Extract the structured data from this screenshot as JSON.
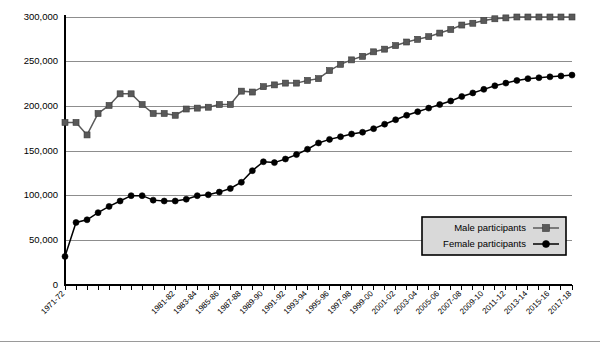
{
  "chart_data": {
    "type": "line",
    "title": "",
    "subtitle": "",
    "xlabel": "",
    "ylabel": "",
    "ylim": [
      0,
      300000
    ],
    "ytick_values": [
      0,
      50000,
      100000,
      150000,
      200000,
      250000,
      300000
    ],
    "ytick_labels": [
      "0",
      "50,000",
      "100,000",
      "150,000",
      "200,000",
      "250,000",
      "300,000"
    ],
    "grid": true,
    "legend_position": "bottom-right-inside",
    "x": [
      "1971-72",
      "1972-73",
      "1973-74",
      "1974-75",
      "1975-76",
      "1976-77",
      "1977-78",
      "1978-79",
      "1979-80",
      "1980-81",
      "1981-82",
      "1982-83",
      "1983-84",
      "1984-85",
      "1985-86",
      "1986-87",
      "1987-88",
      "1988-89",
      "1989-90",
      "1990-91",
      "1991-92",
      "1992-93",
      "1993-94",
      "1994-95",
      "1995-96",
      "1996-97",
      "1997-98",
      "1998-99",
      "1999-00",
      "2000-01",
      "2001-02",
      "2002-03",
      "2003-04",
      "2004-05",
      "2005-06",
      "2006-07",
      "2007-08",
      "2008-09",
      "2009-10",
      "2010-11",
      "2011-12",
      "2012-13",
      "2013-14",
      "2014-15",
      "2015-16",
      "2016-17",
      "2017-18"
    ],
    "xtick_labels_shown": [
      "1971-72",
      "1981-82",
      "1983-84",
      "1985-86",
      "1987-88",
      "1989-90",
      "1991-92",
      "1993-94",
      "1995-96",
      "1997-98",
      "1999-00",
      "2001-02",
      "2003-04",
      "2005-06",
      "2007-08",
      "2009-10",
      "2011-12",
      "2013-14",
      "2015-16",
      "2017-18"
    ],
    "series": [
      {
        "name": "Male participants",
        "marker": "square",
        "color": "#595959",
        "values": [
          182000,
          182000,
          168000,
          192000,
          201000,
          214000,
          214000,
          202000,
          192000,
          192000,
          190000,
          197000,
          198000,
          199000,
          202000,
          202000,
          217000,
          216000,
          222000,
          224000,
          226000,
          226000,
          229000,
          231000,
          240000,
          247000,
          252000,
          256000,
          261000,
          264000,
          268000,
          272000,
          275000,
          278000,
          282000,
          286000,
          291000,
          293000,
          296000,
          298000,
          299000,
          300000,
          300000,
          300000,
          300000,
          300000,
          300000
        ]
      },
      {
        "name": "Female participants",
        "marker": "circle",
        "color": "#000000",
        "values": [
          32000,
          70000,
          73000,
          81000,
          88000,
          94000,
          100000,
          100000,
          95000,
          94000,
          94000,
          96000,
          100000,
          101000,
          104000,
          108000,
          115000,
          128000,
          138000,
          137000,
          141000,
          146000,
          152000,
          159000,
          163000,
          166000,
          169000,
          171000,
          175000,
          180000,
          185000,
          190000,
          194000,
          198000,
          202000,
          206000,
          211000,
          215000,
          219000,
          223000,
          226000,
          229000,
          231000,
          232000,
          233000,
          234000,
          235000
        ]
      }
    ]
  },
  "legend": {
    "items": [
      {
        "label": "Male participants",
        "marker": "square-marker"
      },
      {
        "label": "Female participants",
        "marker": "circle-marker"
      }
    ]
  }
}
